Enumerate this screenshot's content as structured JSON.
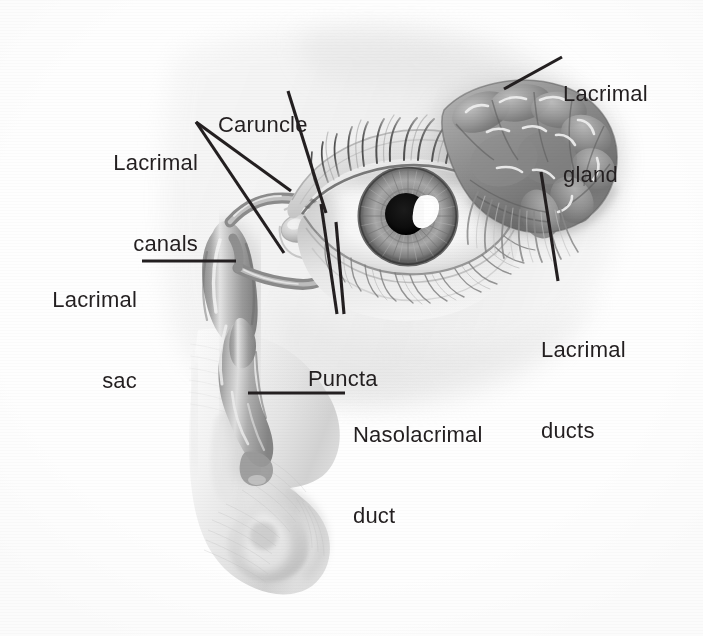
{
  "figure": {
    "background_color": "#ffffff",
    "ink_color": "#231f20",
    "width": 703,
    "height": 636,
    "illustration_style": "grayscale pencil / airbrush medical illustration"
  },
  "labels": {
    "lacrimal_gland": "Lacrimal\ngland",
    "lacrimal_gland_line1": "Lacrimal",
    "lacrimal_gland_line2": "gland",
    "caruncle": "Caruncle",
    "lacrimal_canals_line1": "Lacrimal",
    "lacrimal_canals_line2": "canals",
    "lacrimal_sac_line1": "Lacrimal",
    "lacrimal_sac_line2": "sac",
    "puncta": "Puncta",
    "lacrimal_ducts_line1": "Lacrimal",
    "lacrimal_ducts_line2": "ducts",
    "nasolacrimal_duct_line1": "Nasolacrimal",
    "nasolacrimal_duct_line2": "duct"
  },
  "structures": [
    {
      "name": "lacrimal-gland",
      "label": "Lacrimal gland",
      "description": "lobed almond-shaped gland above the lateral corner of the eye"
    },
    {
      "name": "lacrimal-ducts",
      "label": "Lacrimal ducts",
      "description": "fine ducts draining the gland onto the upper conjunctiva"
    },
    {
      "name": "caruncle",
      "label": "Caruncle",
      "description": "small pink nodule at the medial canthus"
    },
    {
      "name": "lacrimal-canals",
      "label": "Lacrimal canals",
      "description": "superior and inferior canaliculi joining the sac"
    },
    {
      "name": "puncta",
      "label": "Puncta",
      "description": "two tiny openings on the lid margins at the medial canthus"
    },
    {
      "name": "lacrimal-sac",
      "label": "Lacrimal sac",
      "description": "dilated upper part of the tear drainage passage"
    },
    {
      "name": "nasolacrimal-duct",
      "label": "Nasolacrimal duct",
      "description": "duct carrying tears down into the nasal cavity"
    },
    {
      "name": "eye",
      "label": "Eye",
      "description": "right eye with iris, pupil, lids and eyelashes"
    },
    {
      "name": "nose",
      "label": "Nose",
      "description": "lateral profile of the nose in cutaway"
    }
  ],
  "leader_lines": [
    {
      "name": "leader-lacrimal-gland",
      "points": [
        [
          562,
          57
        ],
        [
          504,
          89
        ]
      ]
    },
    {
      "name": "leader-lacrimal-ducts",
      "points": [
        [
          541,
          172
        ],
        [
          558,
          281
        ]
      ]
    },
    {
      "name": "leader-caruncle",
      "points": [
        [
          288,
          91
        ],
        [
          326,
          213
        ]
      ]
    },
    {
      "name": "leader-lacrimal-canals-upper",
      "points": [
        [
          196,
          122
        ],
        [
          291,
          191
        ]
      ]
    },
    {
      "name": "leader-lacrimal-canals-lower",
      "points": [
        [
          196,
          122
        ],
        [
          284,
          253
        ]
      ]
    },
    {
      "name": "leader-lacrimal-sac",
      "points": [
        [
          142,
          261
        ],
        [
          236,
          261
        ]
      ]
    },
    {
      "name": "leader-puncta-left",
      "points": [
        [
          321,
          204
        ],
        [
          337,
          314
        ]
      ]
    },
    {
      "name": "leader-puncta-right",
      "points": [
        [
          336,
          222
        ],
        [
          344,
          314
        ]
      ]
    },
    {
      "name": "leader-nasolacrimal-duct",
      "points": [
        [
          248,
          393
        ],
        [
          345,
          393
        ]
      ]
    }
  ],
  "label_positions": {
    "lacrimal_gland": {
      "x": 563,
      "y": 26,
      "align": "left"
    },
    "caruncle": {
      "x": 218,
      "y": 57,
      "align": "left"
    },
    "lacrimal_canals": {
      "x": 95,
      "y": 95,
      "align": "right",
      "right_edge": 198
    },
    "lacrimal_sac": {
      "x": 42,
      "y": 232,
      "align": "right",
      "right_edge": 137
    },
    "puncta": {
      "x": 308,
      "y": 311,
      "align": "left"
    },
    "lacrimal_ducts": {
      "x": 541,
      "y": 282,
      "align": "left"
    },
    "nasolacrimal_duct": {
      "x": 353,
      "y": 367,
      "align": "left"
    }
  }
}
